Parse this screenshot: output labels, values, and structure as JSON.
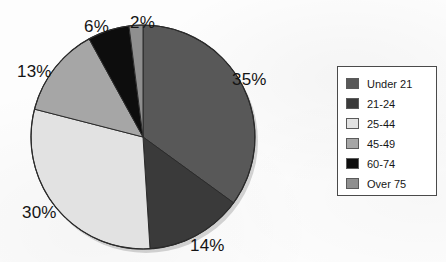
{
  "chart_data": {
    "type": "pie",
    "title": "",
    "labels": [
      "Under 21",
      "21-24",
      "25-44",
      "45-49",
      "60-74",
      "Over 75"
    ],
    "values": [
      35,
      14,
      30,
      13,
      6,
      2
    ],
    "value_labels": [
      "35%",
      "14%",
      "30%",
      "13%",
      "6%",
      "2%"
    ],
    "units": "percent",
    "start_angle_deg": 0,
    "direction": "clockwise",
    "colors": [
      "#585858",
      "#3a3a3a",
      "#e2e2e2",
      "#a6a6a6",
      "#0d0d0d",
      "#8f8f8f"
    ],
    "legend_position": "right",
    "grid": false,
    "slices": [
      {
        "label": "Under 21",
        "value": 35,
        "display": "35%",
        "color": "#585858",
        "label_x": 232,
        "label_y": 70
      },
      {
        "label": "21-24",
        "value": 14,
        "display": "14%",
        "color": "#3a3a3a",
        "label_x": 190,
        "label_y": 236
      },
      {
        "label": "25-44",
        "value": 30,
        "display": "30%",
        "color": "#e2e2e2",
        "label_x": 22,
        "label_y": 203
      },
      {
        "label": "45-49",
        "value": 13,
        "display": "13%",
        "color": "#a6a6a6",
        "label_x": 17,
        "label_y": 62
      },
      {
        "label": "60-74",
        "value": 6,
        "display": "6%",
        "color": "#0d0d0d",
        "label_x": 84,
        "label_y": 17
      },
      {
        "label": "Over 75",
        "value": 2,
        "display": "2%",
        "color": "#8f8f8f",
        "label_x": 130,
        "label_y": 13
      }
    ]
  },
  "legend": {
    "items": [
      {
        "label": "Under 21",
        "color": "#585858"
      },
      {
        "label": "21-24",
        "color": "#3a3a3a"
      },
      {
        "label": "25-44",
        "color": "#e2e2e2"
      },
      {
        "label": "45-49",
        "color": "#a6a6a6"
      },
      {
        "label": "60-74",
        "color": "#0d0d0d"
      },
      {
        "label": "Over 75",
        "color": "#8f8f8f"
      }
    ]
  },
  "geometry": {
    "center_x": 143,
    "center_y": 137,
    "radius": 112
  }
}
